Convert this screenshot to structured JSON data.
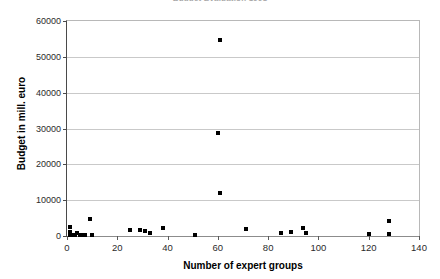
{
  "chart_data": {
    "type": "scatter",
    "title": "Budget Evaluation 1998",
    "xlabel": "Number of expert groups",
    "ylabel": "Budget in mill. euro",
    "xlim": [
      0,
      140
    ],
    "ylim": [
      0,
      60000
    ],
    "xticks": [
      0,
      20,
      40,
      60,
      80,
      100,
      120,
      140
    ],
    "yticks": [
      0,
      10000,
      20000,
      30000,
      40000,
      50000,
      60000
    ],
    "xtick_labels": [
      "0",
      "20",
      "40",
      "60",
      "80",
      "100",
      "120",
      "140"
    ],
    "ytick_labels": [
      "0",
      "10000",
      "20000",
      "30000",
      "40000",
      "50000",
      "60000"
    ],
    "grid": "horizontal",
    "legend": "none",
    "marker": "square",
    "marker_color": "#000000",
    "points": [
      {
        "x": 1,
        "y": 2600
      },
      {
        "x": 1,
        "y": 1100
      },
      {
        "x": 1,
        "y": 300
      },
      {
        "x": 2,
        "y": 400
      },
      {
        "x": 3,
        "y": 200
      },
      {
        "x": 4,
        "y": 900
      },
      {
        "x": 5,
        "y": 250
      },
      {
        "x": 6,
        "y": 300
      },
      {
        "x": 7,
        "y": 250
      },
      {
        "x": 9,
        "y": 4700
      },
      {
        "x": 10,
        "y": 400
      },
      {
        "x": 25,
        "y": 1700
      },
      {
        "x": 29,
        "y": 1800
      },
      {
        "x": 31,
        "y": 1500
      },
      {
        "x": 33,
        "y": 900
      },
      {
        "x": 38,
        "y": 2100
      },
      {
        "x": 51,
        "y": 400
      },
      {
        "x": 60,
        "y": 28800
      },
      {
        "x": 61,
        "y": 54600
      },
      {
        "x": 61,
        "y": 12100
      },
      {
        "x": 71,
        "y": 1900
      },
      {
        "x": 85,
        "y": 700
      },
      {
        "x": 89,
        "y": 1200
      },
      {
        "x": 94,
        "y": 2200
      },
      {
        "x": 95,
        "y": 800
      },
      {
        "x": 120,
        "y": 600
      },
      {
        "x": 128,
        "y": 4200
      },
      {
        "x": 128,
        "y": 500
      }
    ]
  }
}
